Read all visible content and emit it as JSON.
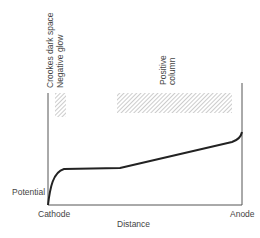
{
  "diagram": {
    "title": "",
    "labels": {
      "crookes_dark_space": "Crookes dark space",
      "negative_glow": "Negative glow",
      "positive_column": "Positive",
      "positive_column_2": "column",
      "potential": "Potential",
      "cathode": "Cathode",
      "distance": "Distance",
      "anode": "Anode"
    },
    "regions": [
      {
        "name": "Crookes dark space / Negative glow",
        "hatched": true
      },
      {
        "name": "Positive column",
        "hatched": true
      }
    ],
    "colors": {
      "line": "#222222",
      "axis": "#555555",
      "hatch": "#9a9a9a"
    }
  }
}
